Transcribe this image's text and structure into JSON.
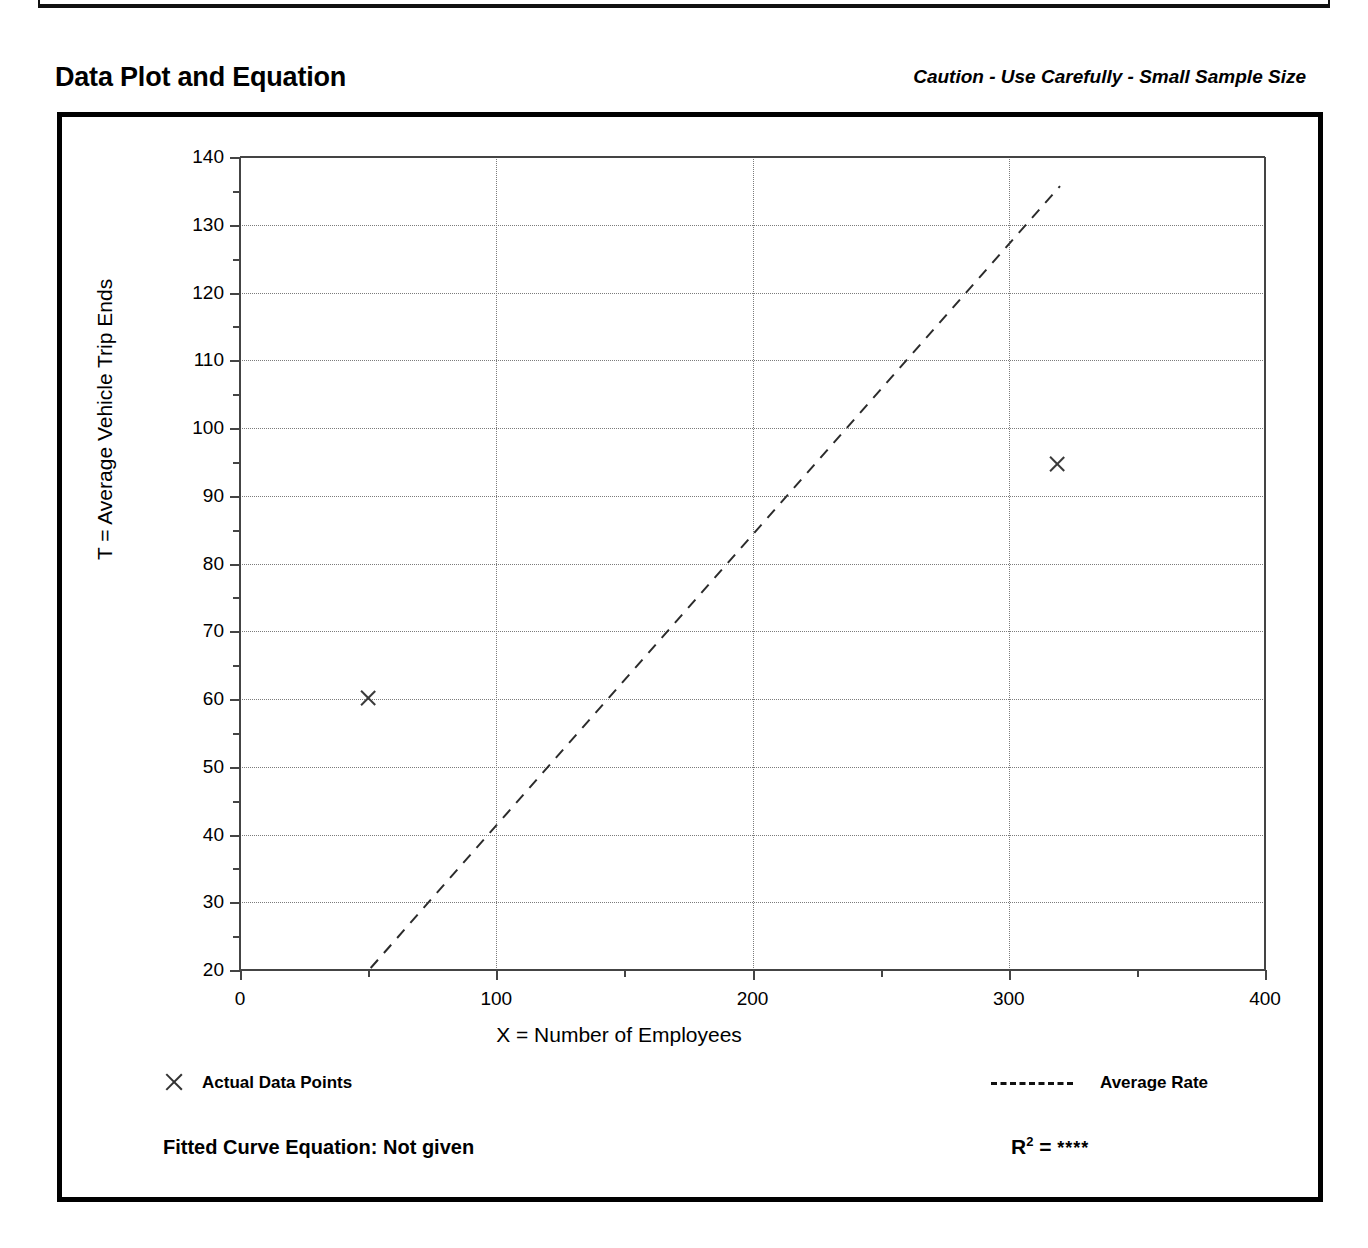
{
  "header": {
    "title": "Data Plot and Equation",
    "caution": "Caution - Use Carefully - Small Sample Size"
  },
  "footer": {
    "legend_points_label": "Actual Data Points",
    "legend_line_label": "Average Rate",
    "equation_label": "Fitted Curve Equation:  Not given",
    "r2_label": "R",
    "r2_exponent": "2",
    "r2_equals": " = ",
    "r2_value": "****"
  },
  "chart_data": {
    "type": "scatter",
    "title": "Data Plot and Equation",
    "xlabel": "X = Number of Employees",
    "ylabel": "T = Average Vehicle Trip Ends",
    "xlim": [
      0,
      400
    ],
    "ylim": [
      20,
      140
    ],
    "xticks": [
      0,
      100,
      200,
      300,
      400
    ],
    "yticks": [
      20,
      30,
      40,
      50,
      60,
      70,
      80,
      90,
      100,
      110,
      120,
      130,
      140
    ],
    "xminor_step": 50,
    "yminor_step": 5,
    "grid": true,
    "grid_style": "dotted",
    "legend_position": "below-plot",
    "series": [
      {
        "name": "Actual Data Points",
        "type": "scatter",
        "marker": "x",
        "points": [
          {
            "x": 50,
            "y": 60.2
          },
          {
            "x": 319,
            "y": 94.7
          }
        ]
      },
      {
        "name": "Average Rate",
        "type": "line",
        "style": "dashed",
        "points": [
          {
            "x": 51,
            "y": 20.3
          },
          {
            "x": 320,
            "y": 135.7
          }
        ]
      }
    ],
    "annotations": {
      "equation": "Fitted Curve Equation:  Not given",
      "r_squared": "****"
    }
  }
}
